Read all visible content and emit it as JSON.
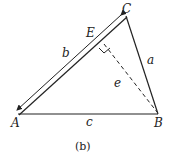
{
  "diagram": {
    "vertices": {
      "A": {
        "label": "A",
        "x": 18,
        "y": 114
      },
      "B": {
        "label": "B",
        "x": 158,
        "y": 113
      },
      "C": {
        "label": "C",
        "x": 126,
        "y": 16
      },
      "E": {
        "label": "E",
        "x": 102,
        "y": 36
      }
    },
    "sides": {
      "a": "a",
      "b": "b",
      "c": "c",
      "e": "e"
    },
    "caption": "(b)",
    "line_color": "#222222"
  }
}
